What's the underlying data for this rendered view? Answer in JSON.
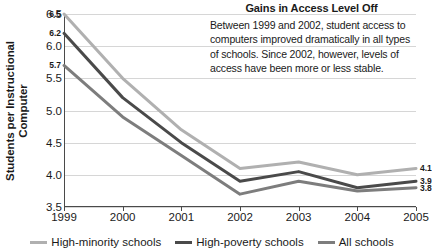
{
  "chart_data": {
    "type": "line",
    "title": "Gains in Access Level Off",
    "xlabel": "",
    "ylabel": "Students per Instructional Computer",
    "ylabel_lines": [
      "Students per Instructional",
      "Computer"
    ],
    "categories": [
      "1999",
      "2000",
      "2001",
      "2002",
      "2003",
      "2004",
      "2005"
    ],
    "x": [
      1999,
      2000,
      2001,
      2002,
      2003,
      2004,
      2005
    ],
    "ylim": [
      3.5,
      6.5
    ],
    "yticks": [
      "6.5",
      "6.0",
      "5.5",
      "5.0",
      "4.5",
      "4.0",
      "3.5"
    ],
    "ytick_values": [
      6.5,
      6.0,
      5.5,
      5.0,
      4.5,
      4.0,
      3.5
    ],
    "grid": true,
    "legend_position": "bottom",
    "series": [
      {
        "name": "High-minority schools",
        "color": "#b0b0b0",
        "values": [
          6.5,
          5.5,
          4.7,
          4.1,
          4.2,
          4.0,
          4.1
        ],
        "start_label": "6.5",
        "end_label": "4.1"
      },
      {
        "name": "High-poverty schools",
        "color": "#4a4a4a",
        "values": [
          6.2,
          5.2,
          4.5,
          3.9,
          4.05,
          3.8,
          3.9
        ],
        "start_label": "6.2",
        "end_label": "3.9"
      },
      {
        "name": "All schools",
        "color": "#7d7d7d",
        "values": [
          5.7,
          4.9,
          4.3,
          3.7,
          3.9,
          3.75,
          3.8
        ],
        "start_label": "5.7",
        "end_label": "3.8"
      }
    ],
    "annotation": {
      "title": "Gains in Access Level Off",
      "body": "Between 1999 and 2002, student access to computers improved dramatically in all types of schools. Since 2002, however, levels of access have been more or less stable."
    }
  },
  "legend": {
    "items": [
      {
        "label": "High-minority schools",
        "color": "#b0b0b0"
      },
      {
        "label": "High-poverty schools",
        "color": "#4a4a4a"
      },
      {
        "label": "All schools",
        "color": "#7d7d7d"
      }
    ]
  }
}
